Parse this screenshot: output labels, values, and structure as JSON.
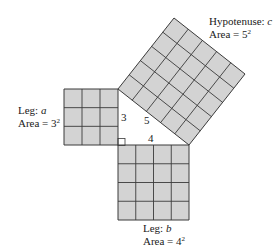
{
  "diagram": {
    "colors": {
      "fill": "#d3d3d3",
      "stroke": "#3a3a3a",
      "background": "#ffffff"
    },
    "labels": {
      "hypotenuse": {
        "line1_prefix": "Hypotenuse: ",
        "line1_var": "c",
        "line2_prefix": "Area = ",
        "base": "5",
        "exp": "2"
      },
      "leg_a": {
        "line1_prefix": "Leg: ",
        "line1_var": "a",
        "line2_prefix": "Area = ",
        "base": "3",
        "exp": "2"
      },
      "leg_b": {
        "line1_prefix": "Leg: ",
        "line1_var": "b",
        "line2_prefix": "Area = ",
        "base": "4",
        "exp": "2"
      }
    },
    "side_lengths": {
      "a": "3",
      "b": "4",
      "c": "5"
    },
    "squares": [
      {
        "name": "leg-a-square",
        "grid": 3
      },
      {
        "name": "leg-b-square",
        "grid": 4
      },
      {
        "name": "hypotenuse-square",
        "grid": 5
      }
    ]
  }
}
